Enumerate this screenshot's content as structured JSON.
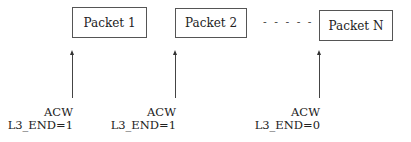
{
  "packets": [
    {
      "label": "Packet 1",
      "x": 72,
      "y": 7,
      "w": 75,
      "h": 31
    },
    {
      "label": "Packet 2",
      "x": 175,
      "y": 8,
      "w": 72,
      "h": 30
    },
    {
      "label": "Packet N",
      "x": 319,
      "y": 10,
      "w": 74,
      "h": 31
    }
  ],
  "ellipsis": "- - - - -",
  "pointers": [
    {
      "x": 72,
      "top": 54,
      "bottom": 98,
      "line1": "ACW",
      "line2": "L3_END=1"
    },
    {
      "x": 175,
      "top": 54,
      "bottom": 98,
      "line1": "ACW",
      "line2": "L3_END=1"
    },
    {
      "x": 319,
      "top": 54,
      "bottom": 98,
      "line1": "ACW",
      "line2": "L3_END=0"
    }
  ]
}
